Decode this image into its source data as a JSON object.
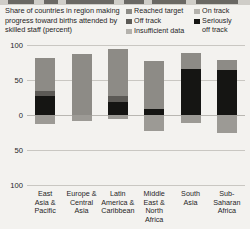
{
  "chart_data": {
    "type": "bar",
    "title": "Share of countries in region making progress toward births attended by skilled staff (percent)",
    "xlabel": "",
    "ylabel": "",
    "ylim": [
      -100,
      100
    ],
    "yticks": [
      100,
      50,
      0,
      50,
      100
    ],
    "ytick_labels": [
      "100",
      "50",
      "0",
      "50",
      "100"
    ],
    "grid": true,
    "legend_position": "top-right",
    "stacked": true,
    "diverging": true,
    "categories": [
      "East\nAsia &\nPacific",
      "Europe &\nCentral\nAsia",
      "Latin\nAmerica &\nCaribbean",
      "Middle\nEast &\nNorth\nAfrica",
      "South\nAsia",
      "Sub-\nSaharan\nAfrica"
    ],
    "series": [
      {
        "name": "Reached target",
        "color": "#8d8b86",
        "values": [
          48,
          87,
          68,
          69,
          22,
          14
        ]
      },
      {
        "name": "On track",
        "color": "#b4b2ad",
        "values": [
          0,
          0,
          0,
          0,
          0,
          0
        ]
      },
      {
        "name": "Off track",
        "color": "#5c5a56",
        "values": [
          7,
          0,
          8,
          0,
          0,
          0
        ]
      },
      {
        "name": "Seriously off track",
        "color": "#151513",
        "values": [
          27,
          0,
          19,
          8,
          66,
          64
        ]
      },
      {
        "name": "Insufficient data",
        "color": "#9c9a95",
        "values": [
          -13,
          -9,
          -5,
          -23,
          -12,
          -26
        ]
      }
    ]
  },
  "legend": {
    "columns": [
      {
        "items": [
          {
            "label": "Reached target",
            "swatch": "#8d8b86"
          },
          {
            "label": "Off track",
            "swatch": "#5c5a56"
          },
          {
            "label": "Insufficient data",
            "swatch": "#b4b2ad"
          }
        ]
      },
      {
        "items": [
          {
            "label": "On track",
            "swatch": "#b4b2ad"
          },
          {
            "label": "Seriously\noff track",
            "swatch": "#151513"
          }
        ]
      }
    ]
  },
  "colors": {
    "background": "#f3f2ef",
    "text": "#26251f",
    "gridline": "#c9c7c2"
  }
}
